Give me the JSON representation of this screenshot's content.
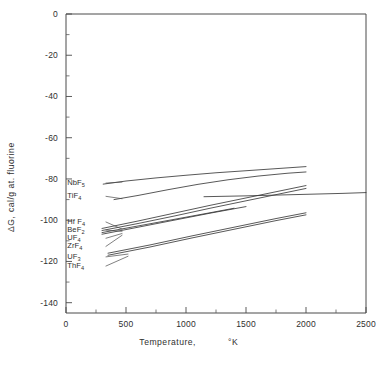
{
  "chart_data": {
    "type": "line",
    "title": "",
    "xlabel": "Temperature,  °K",
    "ylabel": "ΔG,   cal/g at. fluorine",
    "xlim": [
      0,
      2500
    ],
    "ylim": [
      -145,
      0
    ],
    "xticks": [
      0,
      500,
      1000,
      1500,
      2000,
      2500
    ],
    "xticklabels": [
      "0",
      "500",
      "1000",
      "1500",
      "2000",
      "2500"
    ],
    "yticks": [
      0,
      -20,
      -40,
      -60,
      -80,
      -100,
      -120,
      -140
    ],
    "yticklabels": [
      "0",
      "-20",
      "-40",
      "-60",
      "-80",
      "-100",
      "-120",
      "-140"
    ],
    "x_minor_interval": 250,
    "y_minor_interval": 10,
    "grid": false,
    "legend": "inline-labels-left",
    "series": [
      {
        "name": "NbF5",
        "label_text": "NbF",
        "label_sub": "5",
        "label_x": 10,
        "label_y": -81.5,
        "x": [
          310,
          500,
          750,
          1000,
          1250,
          1500,
          1750,
          2000
        ],
        "y": [
          -82.5,
          -81.0,
          -79.5,
          -78.2,
          -77.0,
          -76.0,
          -75.0,
          -74.0
        ]
      },
      {
        "name": "TiF4",
        "label_text": "TiF",
        "label_sub": "4",
        "label_x": 10,
        "label_y": -88.0,
        "x": [
          400,
          600,
          850,
          1100,
          1350,
          1600,
          1850,
          2000
        ],
        "y": [
          -90.0,
          -88.0,
          -85.2,
          -82.6,
          -80.4,
          -78.6,
          -77.2,
          -76.6
        ]
      },
      {
        "name": "HfF4",
        "label_text": "Hf F",
        "label_sub": "4",
        "label_x": 10,
        "label_y": -100.5,
        "x": [
          300,
          600,
          900,
          1200,
          1500,
          1800,
          2000
        ],
        "y": [
          -104.0,
          -100.4,
          -96.6,
          -92.8,
          -89.2,
          -85.6,
          -83.2
        ]
      },
      {
        "name": "BeF2",
        "label_text": "BeF",
        "label_sub": "2",
        "label_x": 10,
        "label_y": -104.5,
        "x": [
          300,
          600,
          900,
          1200,
          1500,
          1800,
          2000
        ],
        "y": [
          -105.0,
          -101.6,
          -98.0,
          -94.2,
          -90.6,
          -87.0,
          -84.6
        ]
      },
      {
        "name": "UF4",
        "label_text": "UF",
        "label_sub": "4",
        "label_x": 10,
        "label_y": -108.5,
        "x": [
          300,
          600,
          900,
          1200,
          1400
        ],
        "y": [
          -106.0,
          -102.8,
          -99.6,
          -96.4,
          -94.2
        ]
      },
      {
        "name": "ZrF4",
        "label_text": "ZrF",
        "label_sub": "4",
        "label_x": 10,
        "label_y": -112.5,
        "x": [
          300,
          600,
          900,
          1200,
          1500
        ],
        "y": [
          -106.8,
          -103.4,
          -100.0,
          -96.6,
          -93.4
        ]
      },
      {
        "name": "UF3",
        "label_text": "UF",
        "label_sub": "3",
        "label_x": 10,
        "label_y": -117.5,
        "x": [
          350,
          700,
          1050,
          1400,
          1750,
          2000
        ],
        "y": [
          -116.0,
          -112.0,
          -107.6,
          -103.4,
          -99.2,
          -96.4
        ]
      },
      {
        "name": "ThF4",
        "label_text": "ThF",
        "label_sub": "4",
        "label_x": 10,
        "label_y": -122.0,
        "x": [
          350,
          700,
          1050,
          1400,
          1750,
          2000
        ],
        "y": [
          -117.0,
          -113.0,
          -108.6,
          -104.4,
          -100.2,
          -97.4
        ]
      },
      {
        "name": "upper-plateau",
        "label_text": "",
        "label_sub": "",
        "label_x": null,
        "label_y": null,
        "x": [
          1150,
          1500,
          1900,
          2300,
          2500
        ],
        "y": [
          -88.6,
          -88.2,
          -87.6,
          -87.0,
          -86.6
        ]
      }
    ],
    "leaders": [
      {
        "from": [
          330,
          -82.0
        ],
        "to": [
          470,
          -81.5
        ]
      },
      {
        "from": [
          330,
          -88.4
        ],
        "to": [
          470,
          -89.6
        ]
      },
      {
        "from": [
          330,
          -100.8
        ],
        "to": [
          470,
          -104.4
        ]
      },
      {
        "from": [
          330,
          -104.8
        ],
        "to": [
          470,
          -105.4
        ]
      },
      {
        "from": [
          330,
          -108.8
        ],
        "to": [
          470,
          -106.4
        ]
      },
      {
        "from": [
          330,
          -112.8
        ],
        "to": [
          470,
          -107.2
        ]
      },
      {
        "from": [
          330,
          -117.8
        ],
        "to": [
          520,
          -116.4
        ]
      },
      {
        "from": [
          330,
          -122.3
        ],
        "to": [
          520,
          -117.4
        ]
      }
    ]
  },
  "axes": {
    "x_title": "Temperature,",
    "x_unit": "°K",
    "y_title_delta": "ΔG,",
    "y_title_units": "cal/g at. fluorine"
  }
}
